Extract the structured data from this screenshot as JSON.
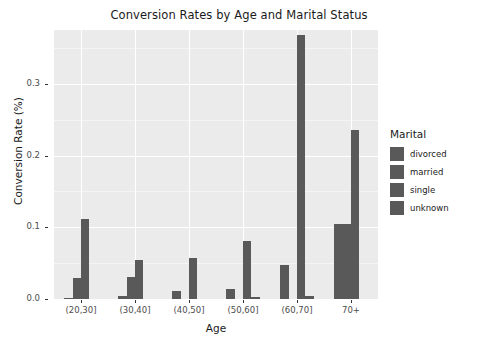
{
  "chart_data": {
    "type": "bar",
    "title": "Conversion Rates by Age and Marital Status",
    "xlabel": "Age",
    "ylabel": "Conversion Rate (%)",
    "categories": [
      "(20,30]",
      "(30,40]",
      "(40,50]",
      "(50,60]",
      "(60,70]",
      "70+"
    ],
    "legend_title": "Marital",
    "legend_position": "right",
    "grid": true,
    "ylim": [
      0.0,
      0.375
    ],
    "yticks": [
      "0.0",
      "0.1",
      "0.2",
      "0.3"
    ],
    "ytick_values": [
      0.0,
      0.1,
      0.2,
      0.3
    ],
    "series": [
      {
        "name": "divorced",
        "color": "#595959",
        "values": [
          0.001,
          0.004,
          0.011,
          0.014,
          0.048,
          0.105
        ]
      },
      {
        "name": "married",
        "color": "#595959",
        "values": [
          0.029,
          0.031,
          0.0,
          0.0,
          0.0,
          0.105
        ]
      },
      {
        "name": "single",
        "color": "#595959",
        "values": [
          0.112,
          0.054,
          0.057,
          0.081,
          0.368,
          0.235
        ]
      },
      {
        "name": "unknown",
        "color": "#595959",
        "values": [
          0.0,
          0.0,
          0.0,
          0.003,
          0.004,
          0.0
        ]
      }
    ]
  },
  "legend": {
    "title": "Marital",
    "items": [
      {
        "label": "divorced"
      },
      {
        "label": "married"
      },
      {
        "label": "single"
      },
      {
        "label": "unknown"
      }
    ]
  },
  "colors": {
    "bar": "#595959",
    "panel_background": "#ebebeb",
    "grid_major": "#ffffff",
    "page_background": "#ffffff",
    "text": "#1a1a1a",
    "axis_text": "#4d4d4d"
  }
}
